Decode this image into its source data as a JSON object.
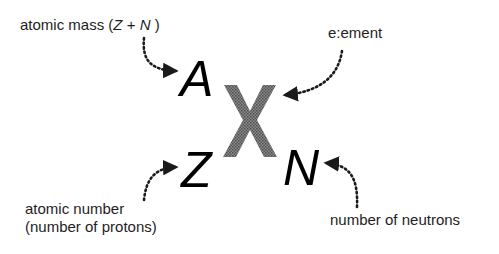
{
  "labels": {
    "atomic_mass_prefix": "atomic mass (",
    "atomic_mass_z": "Z",
    "atomic_mass_plus": " + ",
    "atomic_mass_n": "N",
    "atomic_mass_suffix": " )",
    "element": "e:ement",
    "atomic_number_line1": "atomic number",
    "atomic_number_line2": "(number of protons)",
    "neutrons": "number of neutrons"
  },
  "symbols": {
    "mass_number": "A",
    "element": "X",
    "atomic_number": "Z",
    "neutron_number": "N"
  },
  "colors": {
    "text": "#1e1e1e",
    "element_symbol": "#6e6e6e",
    "arrows": "#1a1a1a"
  }
}
